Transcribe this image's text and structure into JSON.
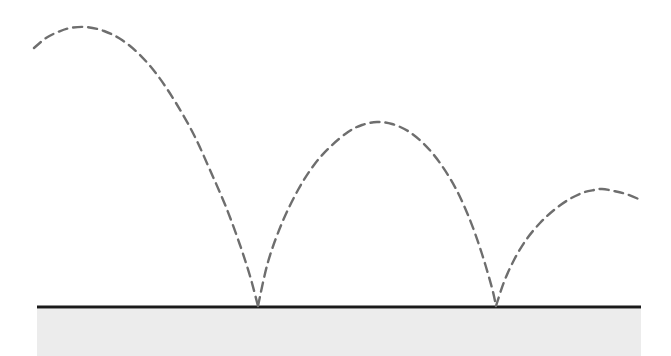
{
  "figure": {
    "width": 671,
    "height": 356,
    "background_color": "#ffffff"
  },
  "ground": {
    "label": "ground-surface",
    "line_color": "#1a1a1a",
    "line_thickness": 3,
    "line_y": 307,
    "line_x_start": 37,
    "line_x_end": 641,
    "fill_color": "#ececec",
    "fill_top": 309,
    "fill_bottom": 356
  },
  "trajectory": {
    "label": "dashed-bouncing-path",
    "stroke_color": "#6e6e6e",
    "stroke_width": 2.4,
    "dash_length": 9,
    "dash_gap": 6,
    "style": "dashed",
    "start_point": {
      "x": 34,
      "y": 48
    },
    "end_point": {
      "x": 641,
      "y": 200
    },
    "bounce_points": [
      {
        "x": 258,
        "y": 306
      },
      {
        "x": 496,
        "y": 306
      }
    ],
    "apex_points": [
      {
        "x": 86,
        "y": 27
      },
      {
        "x": 377,
        "y": 122
      },
      {
        "x": 602,
        "y": 189
      }
    ]
  },
  "chart_data": {
    "type": "line",
    "xlabel": "",
    "ylabel": "",
    "xlim": [
      0,
      671
    ],
    "ylim": [
      356,
      0
    ],
    "grid": false,
    "legend": "none",
    "annotations": [],
    "series": [
      {
        "name": "arc-1",
        "style": "dashed",
        "color": "#6e6e6e",
        "x": [
          34,
          46,
          58,
          70,
          86,
          104,
          122,
          140,
          158,
          176,
          194,
          210,
          226,
          240,
          250,
          258
        ],
        "y": [
          48,
          38,
          32,
          28,
          27,
          31,
          40,
          55,
          76,
          103,
          135,
          170,
          207,
          245,
          276,
          306
        ]
      },
      {
        "name": "arc-2",
        "style": "dashed",
        "color": "#6e6e6e",
        "x": [
          258,
          268,
          282,
          298,
          314,
          330,
          348,
          362,
          377,
          392,
          408,
          424,
          440,
          456,
          470,
          482,
          492,
          496
        ],
        "y": [
          306,
          262,
          223,
          190,
          165,
          147,
          132,
          125,
          122,
          124,
          131,
          144,
          163,
          189,
          220,
          254,
          288,
          306
        ]
      },
      {
        "name": "arc-3",
        "style": "dashed",
        "color": "#6e6e6e",
        "x": [
          496,
          504,
          514,
          526,
          540,
          554,
          568,
          582,
          594,
          602,
          614,
          626,
          641
        ],
        "y": [
          306,
          282,
          260,
          240,
          223,
          210,
          200,
          193,
          190,
          189,
          191,
          194,
          200
        ]
      }
    ],
    "ground_line": {
      "name": "ground",
      "color": "#1a1a1a",
      "x": [
        37,
        641
      ],
      "y": [
        307,
        307
      ]
    }
  }
}
